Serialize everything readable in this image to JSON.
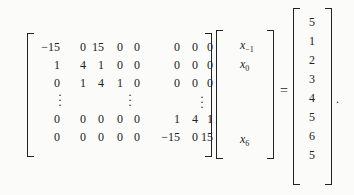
{
  "equation": {
    "matrix": {
      "rows": [
        [
          "−15",
          "0",
          "15",
          "0",
          "0",
          "0",
          "0",
          "0"
        ],
        [
          "1",
          "4",
          "1",
          "0",
          "0",
          "0",
          "0",
          "0"
        ],
        [
          "0",
          "1",
          "4",
          "1",
          "0",
          "0",
          "0",
          "0"
        ],
        [
          "0",
          "0",
          "0",
          "0",
          "0",
          "1",
          "4",
          "1"
        ],
        [
          "0",
          "0",
          "0",
          "0",
          "0",
          "−15",
          "0",
          "15"
        ]
      ],
      "ellipsis": "⋮"
    },
    "unknowns": {
      "x_minus1": {
        "base": "x",
        "sub": "−1"
      },
      "x0": {
        "base": "x",
        "sub": "0"
      },
      "x6": {
        "base": "x",
        "sub": "6"
      }
    },
    "equals": "=",
    "rhs": [
      "5",
      "1",
      "2",
      "3",
      "4",
      "5",
      "6",
      "5"
    ],
    "terminator": "."
  }
}
